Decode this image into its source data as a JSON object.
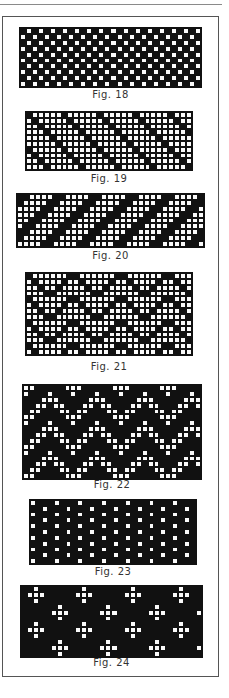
{
  "page": {
    "figures": [
      {
        "id": "fig18",
        "caption": "Fig. 18",
        "pattern": "plain-weave",
        "x": 19,
        "y": 27,
        "cols": 30,
        "rows": 10,
        "cell": 6.1,
        "cap_y": 89
      },
      {
        "id": "fig19",
        "caption": "Fig. 19",
        "pattern": "twill-down-right",
        "x": 25,
        "y": 111,
        "cols": 28,
        "rows": 10,
        "cell": 6.0,
        "cap_y": 173
      },
      {
        "id": "fig20",
        "caption": "Fig. 20",
        "pattern": "twill-up-right-wide",
        "x": 16,
        "y": 193,
        "cols": 31,
        "rows": 9,
        "cell": 6.1,
        "cap_y": 250
      },
      {
        "id": "fig21",
        "caption": "Fig. 21",
        "pattern": "herringbone",
        "x": 25,
        "y": 272,
        "cols": 28,
        "rows": 14,
        "cell": 6.0,
        "cap_y": 361
      },
      {
        "id": "fig22",
        "caption": "Fig. 22",
        "pattern": "zigzag-dark",
        "x": 22,
        "y": 384,
        "cols": 30,
        "rows": 16,
        "cell": 6.0,
        "cap_y": 479
      },
      {
        "id": "fig23",
        "caption": "Fig. 23",
        "pattern": "columns-dots",
        "x": 29,
        "y": 499,
        "cols": 28,
        "rows": 11,
        "cell": 6.0,
        "cap_y": 566
      },
      {
        "id": "fig24",
        "caption": "Fig. 24",
        "pattern": "crosses",
        "x": 20,
        "y": 585,
        "cols": 30,
        "rows": 12,
        "cell": 6.1,
        "cap_y": 657
      }
    ]
  }
}
